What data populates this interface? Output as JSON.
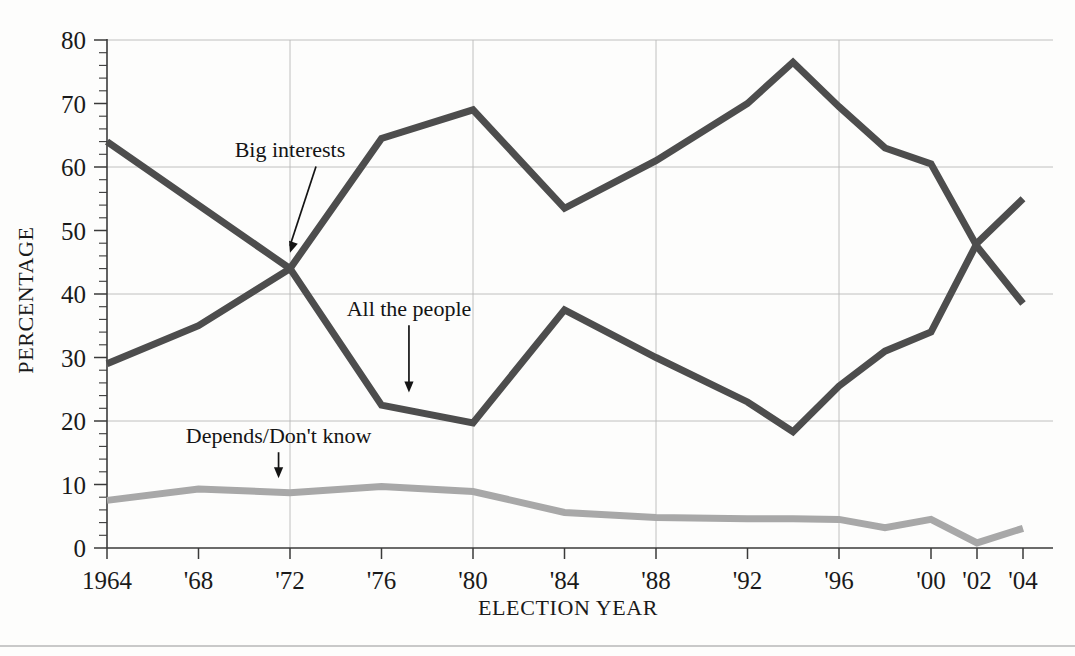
{
  "chart_data": {
    "type": "line",
    "title": "",
    "xlabel": "ELECTION YEAR",
    "ylabel": "PERCENTAGE",
    "ylim": [
      0,
      80
    ],
    "ytick_values": [
      0,
      10,
      20,
      30,
      40,
      50,
      60,
      70,
      80
    ],
    "ytick_labels": [
      "0",
      "10",
      "20",
      "30",
      "40",
      "50",
      "60",
      "70",
      "80"
    ],
    "y_minor_tick_step": 2,
    "gridlines_y": [
      20,
      40,
      60,
      80
    ],
    "gridlines_x": [
      1972,
      1980,
      1988,
      1996
    ],
    "grid": true,
    "legend_position": "inline-annotations",
    "x": [
      1964,
      1968,
      1972,
      1976,
      1980,
      1984,
      1988,
      1992,
      1994,
      1996,
      1998,
      2000,
      2002,
      2004
    ],
    "xtick_labels": [
      "1964",
      "'68",
      "'72",
      "'76",
      "'80",
      "'84",
      "'88",
      "'92",
      "'96",
      "'00",
      "'02",
      "'04"
    ],
    "xtick_values": [
      1964,
      1968,
      1972,
      1976,
      1980,
      1984,
      1988,
      1992,
      1996,
      2000,
      2002,
      2004
    ],
    "series": [
      {
        "name": "Big interests",
        "color": "#4d4d4d",
        "x": [
          1964,
          1968,
          1972,
          1976,
          1980,
          1984,
          1988,
          1992,
          1994,
          1996,
          1998,
          2000,
          2002,
          2004
        ],
        "values": [
          29,
          35,
          44,
          64.5,
          69,
          53.5,
          61,
          70,
          76.5,
          69.5,
          63,
          60.5,
          47.5,
          38.5
        ]
      },
      {
        "name": "All the people",
        "color": "#4d4d4d",
        "x": [
          1964,
          1968,
          1972,
          1976,
          1980,
          1984,
          1988,
          1992,
          1994,
          1996,
          1998,
          2000,
          2002,
          2004
        ],
        "values": [
          64,
          54,
          44,
          22.5,
          19.7,
          37.5,
          30,
          23,
          18.3,
          25.5,
          31,
          34,
          48,
          55
        ]
      },
      {
        "name": "Depends/Don't know",
        "color": "#a8a8a8",
        "x": [
          1964,
          1968,
          1972,
          1976,
          1980,
          1984,
          1988,
          1992,
          1994,
          1996,
          1998,
          2000,
          2002,
          2004
        ],
        "values": [
          7.5,
          9.3,
          8.7,
          9.7,
          8.9,
          5.6,
          4.8,
          4.6,
          4.6,
          4.5,
          3.2,
          4.5,
          0.8,
          3.1
        ]
      }
    ],
    "annotations": [
      {
        "text": "Big interests",
        "label_x": 1972,
        "label_y": 61.5,
        "point_x": 1972,
        "point_y": 46.5
      },
      {
        "text": "All the people",
        "label_x": 1977.2,
        "label_y": 36.5,
        "point_x": 1977.2,
        "point_y": 24.5
      },
      {
        "text": "Depends/Don't know",
        "label_x": 1971.5,
        "label_y": 16.5,
        "point_x": 1971.5,
        "point_y": 11.0
      }
    ]
  }
}
